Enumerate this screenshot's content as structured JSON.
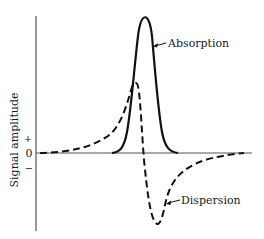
{
  "figure": {
    "y_axis_label": "Signal amplitude",
    "tick_plus": "+",
    "tick_zero": "0",
    "tick_minus": "−",
    "curves": [
      {
        "name": "Absorption",
        "style": "solid",
        "label": "Absorption"
      },
      {
        "name": "Dispersion",
        "style": "dashed",
        "label": "Dispersion"
      }
    ],
    "colors": {
      "line": "#111111",
      "axis": "#555555",
      "background": "#ffffff"
    }
  }
}
